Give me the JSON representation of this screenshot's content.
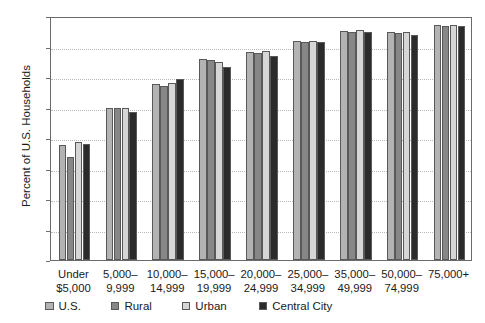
{
  "chart_data": {
    "type": "bar",
    "title": "",
    "xlabel": "",
    "ylabel": "Percent of U.S. Households",
    "ylim": [
      60,
      100
    ],
    "ytick_step": 5,
    "yticks": [
      60,
      65,
      70,
      75,
      80,
      85,
      90,
      95,
      100
    ],
    "grid": true,
    "legend_position": "below-axis",
    "categories": [
      "Under $5,000",
      "5,000–9,999",
      "10,000–14,999",
      "15,000–19,999",
      "20,000–24,999",
      "25,000–34,999",
      "35,000–49,999",
      "50,000–74,999",
      "75,000+"
    ],
    "category_lines": [
      [
        "Under",
        "$5,000"
      ],
      [
        "5,000–",
        "9,999"
      ],
      [
        "10,000–",
        "14,999"
      ],
      [
        "15,000–",
        "19,999"
      ],
      [
        "20,000–",
        "24,999"
      ],
      [
        "25,000–",
        "34,999"
      ],
      [
        "35,000–",
        "49,999"
      ],
      [
        "50,000–",
        "74,999"
      ],
      [
        "75,000+",
        ""
      ]
    ],
    "series": [
      {
        "name": "U.S.",
        "color": "#b3b3b3",
        "values": [
          78.8,
          85.0,
          88.9,
          92.9,
          94.1,
          95.9,
          97.6,
          97.3,
          98.6
        ]
      },
      {
        "name": "Rural",
        "color": "#878787",
        "values": [
          76.9,
          85.0,
          88.6,
          92.8,
          93.9,
          95.8,
          97.3,
          97.2,
          98.3
        ]
      },
      {
        "name": "Urban",
        "color": "#d6d6d6",
        "values": [
          79.4,
          85.0,
          89.1,
          92.5,
          94.2,
          95.9,
          97.7,
          97.4,
          98.5
        ]
      },
      {
        "name": "Central City",
        "color": "#2b2b2b",
        "values": [
          79.0,
          84.3,
          89.6,
          91.7,
          93.5,
          95.7,
          97.3,
          96.9,
          98.4
        ]
      }
    ]
  },
  "legend": {
    "items": [
      {
        "label": "U.S."
      },
      {
        "label": "Rural"
      },
      {
        "label": "Urban"
      },
      {
        "label": "Central City"
      }
    ]
  },
  "axis": {
    "y_title": "Percent of U.S. Households"
  }
}
